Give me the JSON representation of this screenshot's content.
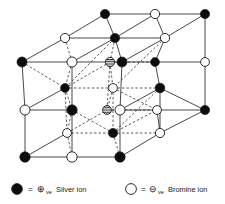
{
  "figure": {
    "colors": {
      "cation_fill": "#0d0d0d",
      "anion_fill": "#ffffff",
      "stroke": "#1a1a1a",
      "background": "#ffffff",
      "hatched_fill": "#9a9a9a"
    },
    "geometry": {
      "width": 225,
      "height": 204,
      "solid_edge_width": 0.8,
      "dashed_edge_width": 0.7,
      "dash_pattern": "2.5 2",
      "node_radius_front": 5.2,
      "node_radius_back": 4.2
    }
  },
  "legend": {
    "items": [
      {
        "marker": "filled-circle",
        "marker_name": "silver-ion-marker",
        "equals": "=",
        "sign": "⊕",
        "sign_name": "plus-circle-icon",
        "charge_suffix": "ve",
        "label": "Silver ion",
        "full_text": "= ⊕ve Silver ion"
      },
      {
        "marker": "open-circle",
        "marker_name": "bromine-ion-marker",
        "equals": "=",
        "sign": "⊖",
        "sign_name": "minus-circle-icon",
        "charge_suffix": "ve",
        "label": "Bromine ion",
        "full_text": "= ⊖ve Bromine ion"
      }
    ]
  },
  "lattice": {
    "ion_types": {
      "cation": "silver",
      "anion": "bromine",
      "interstitial": "hatched"
    },
    "nodes": [
      {
        "id": "n1",
        "x": 105,
        "y": 14,
        "type": "cation",
        "layer": "back",
        "r": 4.6
      },
      {
        "id": "n2",
        "x": 155,
        "y": 14,
        "type": "anion",
        "layer": "back",
        "r": 4.6
      },
      {
        "id": "n3",
        "x": 205,
        "y": 14,
        "type": "cation",
        "layer": "back",
        "r": 4.6
      },
      {
        "id": "n4",
        "x": 65,
        "y": 38,
        "type": "anion",
        "layer": "mid",
        "r": 4.6
      },
      {
        "id": "n5",
        "x": 115,
        "y": 38,
        "type": "cation",
        "layer": "mid",
        "r": 4.6
      },
      {
        "id": "n6",
        "x": 165,
        "y": 38,
        "type": "anion",
        "layer": "mid",
        "r": 4.6
      },
      {
        "id": "n7",
        "x": 22,
        "y": 62,
        "type": "cation",
        "layer": "front",
        "r": 5.0
      },
      {
        "id": "n8",
        "x": 72,
        "y": 62,
        "type": "anion",
        "layer": "front",
        "r": 5.0
      },
      {
        "id": "n9",
        "x": 110,
        "y": 62,
        "type": "hatched",
        "layer": "front",
        "r": 4.6
      },
      {
        "id": "n10",
        "x": 122,
        "y": 62,
        "type": "cation",
        "layer": "front",
        "r": 5.0
      },
      {
        "id": "n11",
        "x": 155,
        "y": 62,
        "type": "cation",
        "layer": "back",
        "r": 4.4
      },
      {
        "id": "n12",
        "x": 205,
        "y": 62,
        "type": "anion",
        "layer": "back",
        "r": 4.4
      },
      {
        "id": "n13",
        "x": 65,
        "y": 88,
        "type": "cation",
        "layer": "mid",
        "r": 4.4
      },
      {
        "id": "n14",
        "x": 113,
        "y": 88,
        "type": "anion",
        "layer": "mid",
        "r": 4.4
      },
      {
        "id": "n15",
        "x": 160,
        "y": 88,
        "type": "cation",
        "layer": "mid",
        "r": 4.8
      },
      {
        "id": "n16",
        "x": 25,
        "y": 110,
        "type": "anion",
        "layer": "front",
        "r": 5.0
      },
      {
        "id": "n17",
        "x": 72,
        "y": 110,
        "type": "cation",
        "layer": "front",
        "r": 5.2
      },
      {
        "id": "n18",
        "x": 107,
        "y": 110,
        "type": "hatched",
        "layer": "front",
        "r": 4.4
      },
      {
        "id": "n19",
        "x": 120,
        "y": 110,
        "type": "anion",
        "layer": "front",
        "r": 5.0
      },
      {
        "id": "n20",
        "x": 157,
        "y": 110,
        "type": "anion",
        "layer": "back",
        "r": 4.4
      },
      {
        "id": "n21",
        "x": 205,
        "y": 110,
        "type": "cation",
        "layer": "back",
        "r": 4.6
      },
      {
        "id": "n22",
        "x": 67,
        "y": 133,
        "type": "anion",
        "layer": "mid",
        "r": 4.4
      },
      {
        "id": "n23",
        "x": 113,
        "y": 133,
        "type": "cation",
        "layer": "mid",
        "r": 4.6
      },
      {
        "id": "n24",
        "x": 160,
        "y": 133,
        "type": "anion",
        "layer": "mid",
        "r": 4.6
      },
      {
        "id": "n25",
        "x": 25,
        "y": 157,
        "type": "cation",
        "layer": "front",
        "r": 5.2
      },
      {
        "id": "n26",
        "x": 72,
        "y": 157,
        "type": "anion",
        "layer": "front",
        "r": 5.2
      },
      {
        "id": "n27",
        "x": 120,
        "y": 157,
        "type": "cation",
        "layer": "front",
        "r": 5.2
      }
    ],
    "solid_edges": [
      [
        "n1",
        "n2"
      ],
      [
        "n2",
        "n3"
      ],
      [
        "n4",
        "n5"
      ],
      [
        "n5",
        "n6"
      ],
      [
        "n7",
        "n8"
      ],
      [
        "n8",
        "n9"
      ],
      [
        "n10",
        "n11"
      ],
      [
        "n11",
        "n12"
      ],
      [
        "n16",
        "n17"
      ],
      [
        "n19",
        "n20"
      ],
      [
        "n20",
        "n21"
      ],
      [
        "n25",
        "n26"
      ],
      [
        "n26",
        "n27"
      ],
      [
        "n4",
        "n1"
      ],
      [
        "n6",
        "n3"
      ],
      [
        "n5",
        "n2"
      ],
      [
        "n7",
        "n4"
      ],
      [
        "n8",
        "n5"
      ],
      [
        "n10",
        "n6"
      ],
      [
        "n16",
        "n13"
      ],
      [
        "n19",
        "n15"
      ],
      [
        "n25",
        "n22"
      ],
      [
        "n27",
        "n24"
      ],
      [
        "n11",
        "n6"
      ],
      [
        "n12",
        "n3"
      ],
      [
        "n21",
        "n15"
      ],
      [
        "n24",
        "n21"
      ],
      [
        "n7",
        "n16"
      ],
      [
        "n16",
        "n25"
      ],
      [
        "n10",
        "n19"
      ],
      [
        "n12",
        "n21"
      ],
      [
        "n1",
        "n5"
      ],
      [
        "n8",
        "n17"
      ],
      [
        "n17",
        "n26"
      ],
      [
        "n2",
        "n6"
      ],
      [
        "n5",
        "n10"
      ],
      [
        "n15",
        "n24"
      ],
      [
        "n11",
        "n15"
      ],
      [
        "n20",
        "n24"
      ],
      [
        "n19",
        "n27"
      ]
    ],
    "dashed_edges": [
      [
        "n5",
        "n9"
      ],
      [
        "n9",
        "n14"
      ],
      [
        "n14",
        "n18"
      ],
      [
        "n13",
        "n14"
      ],
      [
        "n14",
        "n15"
      ],
      [
        "n22",
        "n23"
      ],
      [
        "n23",
        "n24"
      ],
      [
        "n4",
        "n8"
      ],
      [
        "n13",
        "n17"
      ],
      [
        "n22",
        "n26"
      ],
      [
        "n9",
        "n11"
      ],
      [
        "n18",
        "n20"
      ],
      [
        "n13",
        "n22"
      ],
      [
        "n14",
        "n23"
      ],
      [
        "n7",
        "n13"
      ],
      [
        "n17",
        "n23"
      ],
      [
        "n23",
        "n27"
      ],
      [
        "n9",
        "n10"
      ],
      [
        "n18",
        "n19"
      ],
      [
        "n8",
        "n13"
      ],
      [
        "n17",
        "n22"
      ],
      [
        "n6",
        "n14"
      ],
      [
        "n15",
        "n23"
      ],
      [
        "n14",
        "n20"
      ],
      [
        "n23",
        "n20"
      ],
      [
        "n5",
        "n13"
      ],
      [
        "n9",
        "n18"
      ],
      [
        "n13",
        "n9"
      ],
      [
        "n22",
        "n18"
      ]
    ]
  }
}
